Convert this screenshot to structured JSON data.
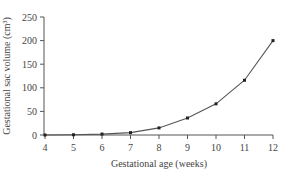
{
  "chart_data": {
    "type": "line",
    "title": "",
    "xlabel": "Gestational age (weeks)",
    "ylabel": "Gestational sac volume (cm³)",
    "x": [
      4,
      5,
      6,
      7,
      8,
      9,
      10,
      11,
      12
    ],
    "series": [
      {
        "name": "Gestational sac volume",
        "values": [
          0,
          0.5,
          2,
          5,
          15,
          36,
          66,
          116,
          200
        ]
      }
    ],
    "xlim": [
      4,
      12
    ],
    "ylim": [
      0,
      250
    ],
    "xticks": [
      "4",
      "5",
      "6",
      "7",
      "8",
      "9",
      "10",
      "11",
      "12"
    ],
    "yticks": [
      "0",
      "50",
      "100",
      "150",
      "200",
      "250"
    ],
    "grid": false,
    "legend": null,
    "line_color": "#555555",
    "marker_color": "#222222"
  }
}
